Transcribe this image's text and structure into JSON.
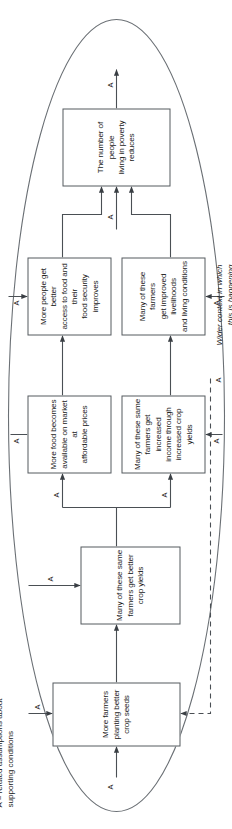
{
  "diagram": {
    "title_legend": "A = related assumptions about\nsupporting conditions",
    "context_label": "Wider context in which\nthis is happening",
    "assumption_marker": "A",
    "boundary_shape": "ellipse",
    "colors": {
      "box_border": "#555a5f",
      "box_fill": "#ffffff",
      "line": "#4a4f54",
      "text": "#1a1a1a",
      "background": "#ffffff"
    },
    "nodes": [
      {
        "id": "seeds",
        "label": "More farmers\nplanting better\ncrop seeds"
      },
      {
        "id": "yields",
        "label": "Many of these same\nfarmers get better\ncrop yields"
      },
      {
        "id": "food_market",
        "label": "More food becomes\navailable on market at\naffordable prices"
      },
      {
        "id": "income",
        "label": "Many of these same\nfarmers get increased\nincome through\nincreased crop yields"
      },
      {
        "id": "food_access",
        "label": "More people get better\naccess to food and their\nfood security improves"
      },
      {
        "id": "livelihoods",
        "label": "Many of these farmers\nget improved livelihoods\nand living conditions"
      },
      {
        "id": "poverty",
        "label": "The number of people\nliving in poverty\nreduces"
      }
    ],
    "edges": [
      {
        "from": "seeds",
        "to": "yields",
        "style": "solid"
      },
      {
        "from": "yields",
        "to": "food_market",
        "style": "solid"
      },
      {
        "from": "yields",
        "to": "income",
        "style": "solid"
      },
      {
        "from": "food_market",
        "to": "food_access",
        "style": "solid"
      },
      {
        "from": "income",
        "to": "livelihoods",
        "style": "solid"
      },
      {
        "from": "food_access",
        "to": "poverty",
        "style": "solid"
      },
      {
        "from": "livelihoods",
        "to": "poverty",
        "style": "solid"
      },
      {
        "from": "context",
        "to": "seeds",
        "style": "dashed"
      }
    ],
    "assumption_markers_count": 12
  }
}
